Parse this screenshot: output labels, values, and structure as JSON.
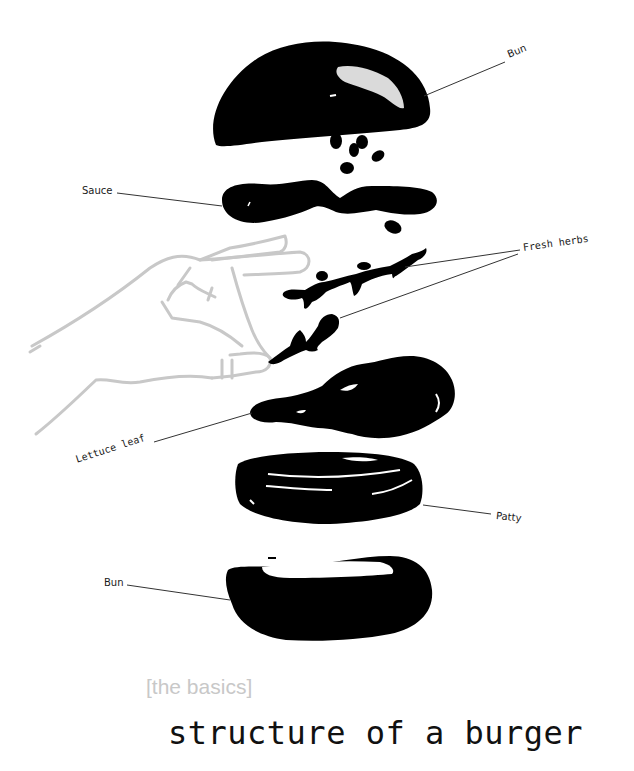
{
  "illustration": {
    "colors": {
      "ink": "#000000",
      "hand_outline": "#c8c8c8",
      "leader_line": "#333333",
      "background": "#ffffff"
    },
    "layers": [
      {
        "id": "top-bun",
        "name": "Bun"
      },
      {
        "id": "sauce",
        "name": "Sauce"
      },
      {
        "id": "fresh-herbs",
        "name": "Fresh herbs"
      },
      {
        "id": "lettuce-leaf",
        "name": "Lettuce leaf"
      },
      {
        "id": "patty",
        "name": "Patty"
      },
      {
        "id": "bottom-bun",
        "name": "Bun"
      }
    ]
  },
  "labels": {
    "top_bun": "Bun",
    "sauce": "Sauce",
    "fresh_herbs": "Fresh herbs",
    "lettuce_leaf": "Lettuce leaf",
    "patty": "Patty",
    "bottom_bun": "Bun"
  },
  "caption": {
    "subtitle": "[the basics]",
    "title": "structure of a burger"
  }
}
